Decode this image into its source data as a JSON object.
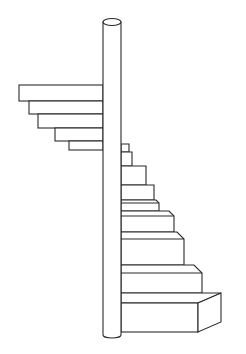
{
  "figure": {
    "title": "Spiral staircase line drawing",
    "stroke_color": "#2a2a2a",
    "background_color": "#ffffff"
  },
  "pillar": {
    "x_left": 103,
    "x_right": 121,
    "y_top": 22,
    "y_bottom": 335
  },
  "left_steps": [
    {
      "x": 19,
      "y1": 85,
      "y2": 101
    },
    {
      "x": 29,
      "y1": 101,
      "y2": 114
    },
    {
      "x": 38,
      "y1": 114,
      "y2": 128
    },
    {
      "x": 55,
      "y1": 128,
      "y2": 141
    },
    {
      "x": 69,
      "y1": 141,
      "y2": 150
    }
  ],
  "right_steps": [
    {
      "x": 129,
      "y1": 144,
      "y2": 152
    },
    {
      "x": 132,
      "y1": 152,
      "y2": 166
    },
    {
      "x": 146,
      "y1": 166,
      "y2": 185
    },
    {
      "x": 154,
      "y1": 185,
      "y2": 200
    },
    {
      "x": 159,
      "y1": 200,
      "y2": 211
    },
    {
      "x": 174,
      "y1": 211,
      "y2": 232
    },
    {
      "x": 184,
      "y1": 232,
      "y2": 265
    },
    {
      "x": 202,
      "y1": 265,
      "y2": 293
    }
  ],
  "bottom_block": {
    "x_front": 198,
    "x_side": 221,
    "y_top": 293,
    "y_bottom": 332
  }
}
